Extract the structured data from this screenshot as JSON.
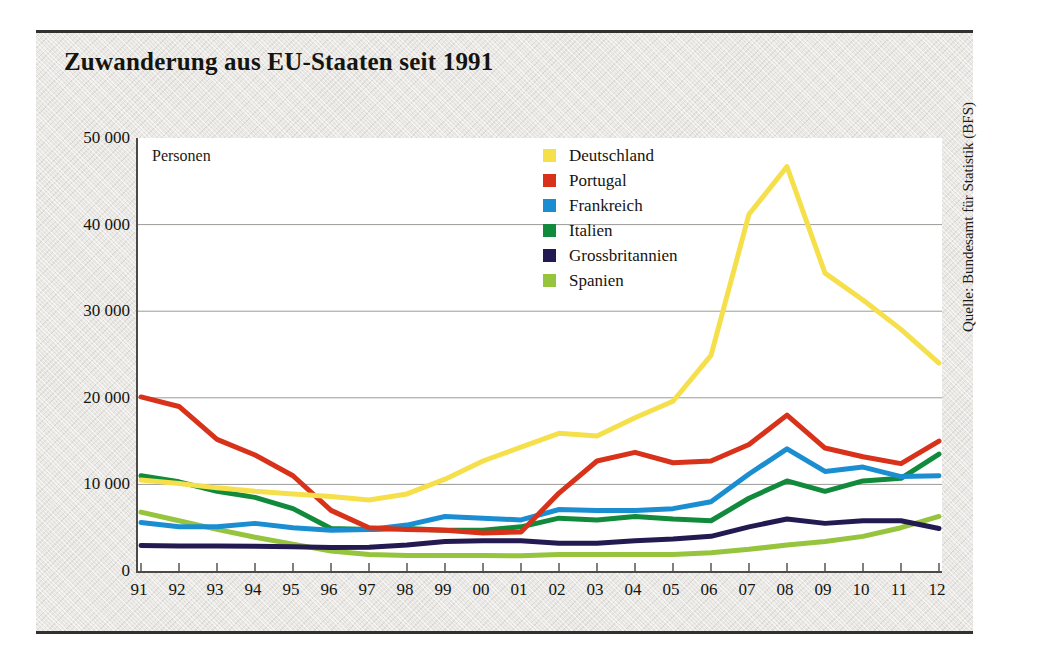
{
  "title": "Zuwanderung aus EU-Staaten seit 1991",
  "axis_note": "Personen",
  "source": "Quelle: Bundesamt für Statistik (BFS)",
  "legend": [
    {
      "label": "Deutschland",
      "color": "#f5e04b"
    },
    {
      "label": "Portugal",
      "color": "#d8321a"
    },
    {
      "label": "Frankreich",
      "color": "#1b8ed2"
    },
    {
      "label": "Italien",
      "color": "#128a3c"
    },
    {
      "label": "Grossbritannien",
      "color": "#241a52"
    },
    {
      "label": "Spanien",
      "color": "#96c43c"
    }
  ],
  "y_ticks": [
    "0",
    "10 000",
    "20 000",
    "30 000",
    "40 000",
    "50 000"
  ],
  "x_ticks": [
    "91",
    "92",
    "93",
    "94",
    "95",
    "96",
    "97",
    "98",
    "99",
    "00",
    "01",
    "02",
    "03",
    "04",
    "05",
    "06",
    "07",
    "08",
    "09",
    "10",
    "11",
    "12"
  ],
  "chart_data": {
    "type": "line",
    "title": "Zuwanderung aus EU-Staaten seit 1991",
    "xlabel": "",
    "ylabel": "Personen",
    "ylim": [
      0,
      50000
    ],
    "ytick_values": [
      0,
      10000,
      20000,
      30000,
      40000,
      50000
    ],
    "grid": "horizontal",
    "legend_position": "inside-top-right",
    "categories": [
      "1991",
      "1992",
      "1993",
      "1994",
      "1995",
      "1996",
      "1997",
      "1998",
      "1999",
      "2000",
      "2001",
      "2002",
      "2003",
      "2004",
      "2005",
      "2006",
      "2007",
      "2008",
      "2009",
      "2010",
      "2011",
      "2012"
    ],
    "series": [
      {
        "name": "Deutschland",
        "color": "#f5e04b",
        "values": [
          10500,
          10100,
          9600,
          9200,
          8900,
          8600,
          8200,
          8900,
          10600,
          12700,
          14300,
          15900,
          15600,
          17700,
          19600,
          24900,
          41200,
          46700,
          34400,
          31300,
          27900,
          24000
        ]
      },
      {
        "name": "Portugal",
        "color": "#d8321a",
        "values": [
          20100,
          19000,
          15200,
          13400,
          11000,
          7000,
          5000,
          4800,
          4700,
          4400,
          4500,
          9000,
          12700,
          13700,
          12500,
          12700,
          14600,
          18000,
          14200,
          13200,
          12400,
          15000
        ]
      },
      {
        "name": "Frankreich",
        "color": "#1b8ed2",
        "values": [
          5600,
          5100,
          5100,
          5500,
          5000,
          4700,
          4800,
          5300,
          6300,
          6100,
          5900,
          7100,
          7000,
          7000,
          7200,
          8000,
          11200,
          14100,
          11500,
          12000,
          10900,
          11000
        ]
      },
      {
        "name": "Italien",
        "color": "#128a3c",
        "values": [
          11000,
          10300,
          9200,
          8500,
          7200,
          4900,
          4800,
          4900,
          4700,
          4700,
          5100,
          6100,
          5900,
          6300,
          6000,
          5800,
          8400,
          10400,
          9200,
          10400,
          10700,
          13500
        ]
      },
      {
        "name": "Grossbritannien",
        "color": "#241a52",
        "values": [
          2950,
          2900,
          2900,
          2850,
          2800,
          2700,
          2750,
          3000,
          3400,
          3500,
          3500,
          3200,
          3200,
          3500,
          3700,
          4000,
          5100,
          6000,
          5500,
          5800,
          5800,
          4900
        ]
      },
      {
        "name": "Spanien",
        "color": "#96c43c",
        "values": [
          6800,
          5800,
          4800,
          3900,
          3100,
          2300,
          1900,
          1800,
          1800,
          1800,
          1750,
          1900,
          1900,
          1900,
          1900,
          2100,
          2500,
          3000,
          3400,
          4000,
          5000,
          6300
        ]
      }
    ]
  }
}
